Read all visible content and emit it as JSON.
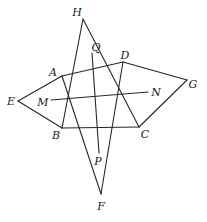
{
  "figure": {
    "type": "geometry-diagram",
    "width": 207,
    "height": 222,
    "background_color": "#ffffff",
    "stroke_color": "#262626",
    "stroke_width": 1.1,
    "points": {
      "H": {
        "label": "H",
        "x": 83,
        "y": 19,
        "label_x": 77,
        "label_y": 12
      },
      "Q": {
        "label": "Q",
        "x": 92,
        "y": 53,
        "label_x": 96,
        "label_y": 47
      },
      "D": {
        "label": "D",
        "x": 123,
        "y": 62,
        "label_x": 125,
        "label_y": 55
      },
      "A": {
        "label": "A",
        "x": 62,
        "y": 76,
        "label_x": 53,
        "label_y": 72
      },
      "G": {
        "label": "G",
        "x": 187,
        "y": 80,
        "label_x": 193,
        "label_y": 84
      },
      "E": {
        "label": "E",
        "x": 18,
        "y": 101,
        "label_x": 11,
        "label_y": 101
      },
      "M": {
        "label": "M",
        "x": 51,
        "y": 100,
        "label_x": 43,
        "label_y": 102
      },
      "N": {
        "label": "N",
        "x": 148,
        "y": 92,
        "label_x": 156,
        "label_y": 92
      },
      "B": {
        "label": "B",
        "x": 62,
        "y": 128,
        "label_x": 56,
        "label_y": 135
      },
      "C": {
        "label": "C",
        "x": 139,
        "y": 127,
        "label_x": 145,
        "label_y": 134
      },
      "P": {
        "label": "P",
        "x": 99,
        "y": 153,
        "label_x": 98,
        "label_y": 161
      },
      "F": {
        "label": "F",
        "x": 101,
        "y": 194,
        "label_x": 101,
        "label_y": 206
      }
    },
    "segments": [
      {
        "name": "segment-HB",
        "from": "H",
        "to": "B"
      },
      {
        "name": "segment-HC",
        "from": "H",
        "to": "C"
      },
      {
        "name": "segment-EA",
        "from": "E",
        "to": "A"
      },
      {
        "name": "segment-EB",
        "from": "E",
        "to": "B"
      },
      {
        "name": "segment-GD",
        "from": "G",
        "to": "D"
      },
      {
        "name": "segment-GC",
        "from": "G",
        "to": "C"
      },
      {
        "name": "segment-FA",
        "from": "F",
        "to": "A"
      },
      {
        "name": "segment-FD",
        "from": "F",
        "to": "D"
      },
      {
        "name": "segment-AD",
        "from": "A",
        "to": "D"
      },
      {
        "name": "segment-BC",
        "from": "B",
        "to": "C"
      },
      {
        "name": "segment-MN",
        "from": "M",
        "to": "N"
      },
      {
        "name": "segment-QP",
        "from": "Q",
        "to": "P"
      }
    ]
  }
}
